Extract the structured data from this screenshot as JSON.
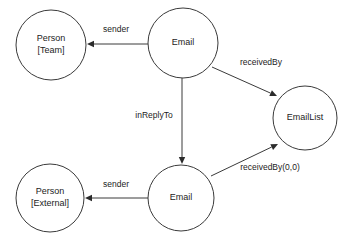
{
  "diagram": {
    "type": "entity-relationship-graph",
    "background_color": "#ffffff",
    "stroke_color": "#3a3a3a",
    "text_color": "#1c1c1c",
    "nodes": [
      {
        "id": "person-team",
        "label_line1": "Person",
        "label_line2": "[Team]",
        "cx": 51,
        "cy": 45,
        "r": 35
      },
      {
        "id": "email-top",
        "label_line1": "Email",
        "label_line2": "",
        "cx": 183,
        "cy": 43,
        "r": 35
      },
      {
        "id": "email-list",
        "label_line1": "EmailList",
        "label_line2": "",
        "cx": 305,
        "cy": 118,
        "r": 32
      },
      {
        "id": "person-external",
        "label_line1": "Person",
        "label_line2": "[External]",
        "cx": 50,
        "cy": 198,
        "r": 34
      },
      {
        "id": "email-bottom",
        "label_line1": "Email",
        "label_line2": "",
        "cx": 181,
        "cy": 198,
        "r": 33
      }
    ],
    "edges": [
      {
        "id": "edge-sender-top",
        "label": "sender",
        "from": "email-top",
        "to": "person-team",
        "x1": 148,
        "y1": 44,
        "x2": 87,
        "y2": 44,
        "label_x": 116,
        "label_y": 30
      },
      {
        "id": "edge-receivedby",
        "label": "receivedBy",
        "from": "email-top",
        "to": "email-list",
        "x1": 212,
        "y1": 67,
        "x2": 277,
        "y2": 96,
        "label_x": 261,
        "label_y": 63
      },
      {
        "id": "edge-inreplyto",
        "label": "inReplyTo",
        "from": "email-top",
        "to": "email-bottom",
        "x1": 182,
        "y1": 78,
        "x2": 182,
        "y2": 164,
        "label_x": 154,
        "label_y": 116
      },
      {
        "id": "edge-sender-bottom",
        "label": "sender",
        "from": "email-bottom",
        "to": "person-external",
        "x1": 148,
        "y1": 198,
        "x2": 85,
        "y2": 198,
        "label_x": 116,
        "label_y": 185
      },
      {
        "id": "edge-receivedby-00",
        "label": "receivedBy(0,0)",
        "from": "email-bottom",
        "to": "email-list",
        "x1": 211,
        "y1": 176,
        "x2": 278,
        "y2": 144,
        "label_x": 270,
        "label_y": 168
      }
    ]
  }
}
